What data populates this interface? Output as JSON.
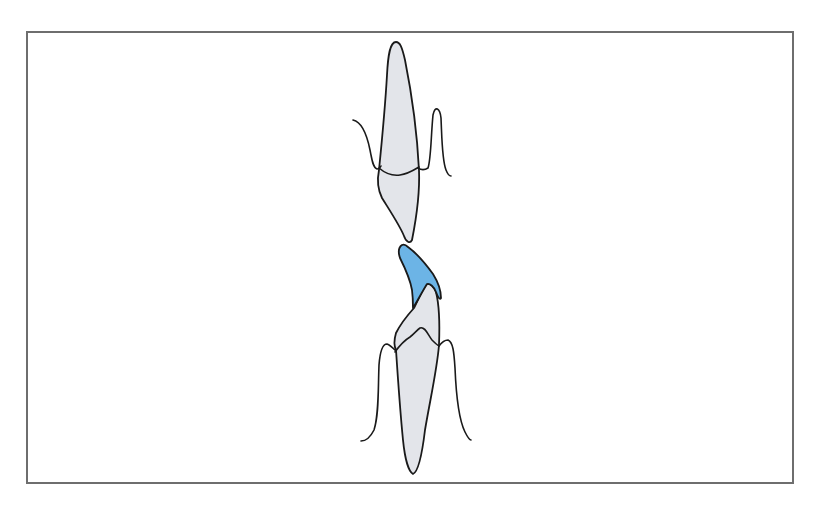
{
  "figure": {
    "frame_color": "#6e6e6e",
    "tooth_fill": "#e3e5ea",
    "outline_color": "#1a1a1a",
    "restoration_color": "#6cb4e6",
    "elements": [
      {
        "name": "upper-tooth",
        "label": "Upper incisor"
      },
      {
        "name": "lower-tooth",
        "label": "Lower incisor"
      },
      {
        "name": "restoration",
        "label": "Incisal restoration (blue)"
      },
      {
        "name": "upper-gingiva",
        "label": "Upper gingival outline"
      },
      {
        "name": "lower-gingiva",
        "label": "Lower gingival outline"
      }
    ]
  }
}
